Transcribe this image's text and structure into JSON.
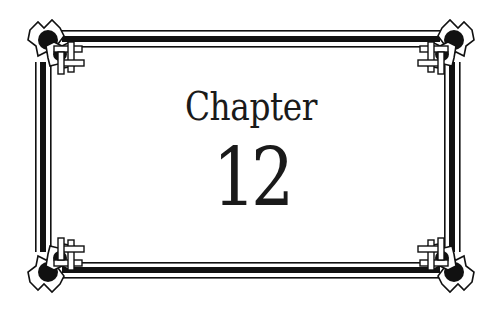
{
  "page": {
    "heading": "Chapter",
    "number": "12"
  },
  "decoration": {
    "border_style": "celtic-knot-corner-frame",
    "ink_color": "#111111",
    "paper_color": "#ffffff"
  }
}
